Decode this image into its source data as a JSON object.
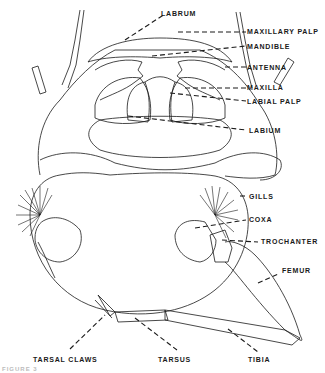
{
  "diagram": {
    "labels": {
      "labrum": "LABRUM",
      "maxillary_palp": "MAXILLARY PALP",
      "mandible": "MANDIBLE",
      "antenna": "ANTENNA",
      "maxilla": "MAXILLA",
      "labial_palp": "LABIAL PALP",
      "labium": "LABIUM",
      "gills": "GILLS",
      "coxa": "COXA",
      "trochanter": "TROCHANTER",
      "femur": "FEMUR",
      "tarsal_claws": "TARSAL CLAWS",
      "tarsus": "TARSUS",
      "tibia": "TIBIA"
    },
    "caption": "FIGURE 3"
  },
  "colors": {
    "ink": "#1a1a1a",
    "background": "#ffffff"
  }
}
